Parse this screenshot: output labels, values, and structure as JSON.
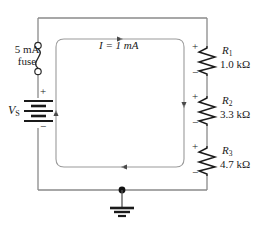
{
  "figure": {
    "type": "electrical-circuit-schematic"
  },
  "source": {
    "label": "V",
    "label_sub": "S",
    "plus": "+",
    "minus": "−",
    "symbol": "battery-symbol"
  },
  "fuse": {
    "rating": "5 mA",
    "name": "fuse",
    "symbol": "fuse-symbol"
  },
  "current": {
    "label": "I = 1 mA",
    "symbol": "current-arrow",
    "direction": "clockwise"
  },
  "ground": {
    "symbol": "earth-ground-symbol",
    "node": "junction-dot"
  },
  "resistors": [
    {
      "name": "R",
      "name_sub": "1",
      "value": "1.0 kΩ",
      "plus": "+",
      "minus": "−"
    },
    {
      "name": "R",
      "name_sub": "2",
      "value": "3.3 kΩ",
      "plus": "+",
      "minus": "−"
    },
    {
      "name": "R",
      "name_sub": "3",
      "value": "4.7 kΩ",
      "plus": "+",
      "minus": "−"
    }
  ],
  "colors": {
    "wire": "#7d7d7d",
    "component": "#1a1a1a",
    "text": "#1a1a1a",
    "background": "#ffffff"
  }
}
